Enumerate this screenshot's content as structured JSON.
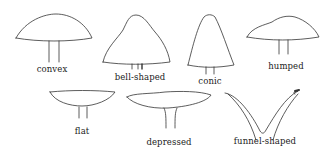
{
  "diagram": {
    "stroke_color": "#333333",
    "background": "#ffffff",
    "items": [
      {
        "id": "convex",
        "label": "convex"
      },
      {
        "id": "bell-shaped",
        "label": "bell-shaped"
      },
      {
        "id": "conic",
        "label": "conic"
      },
      {
        "id": "humped",
        "label": "humped"
      },
      {
        "id": "flat",
        "label": "flat"
      },
      {
        "id": "depressed",
        "label": "depressed"
      },
      {
        "id": "funnel-shaped",
        "label": "funnel-shaped"
      }
    ]
  }
}
